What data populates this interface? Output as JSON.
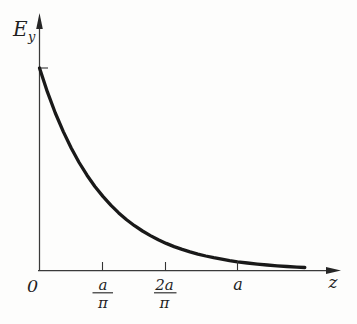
{
  "labels": {
    "y_axis": {
      "main": "E",
      "sub": "y"
    },
    "x_axis": "z",
    "origin": "0"
  },
  "chart_data": {
    "type": "line",
    "title": "",
    "xlabel": "z",
    "ylabel": "Ey",
    "curve_model": "Ey/E0 = exp(-pi*z/a)",
    "x_unit": "z in units of a",
    "y_unit": "Ey in units of E0 (E0 marked by unlabeled tick on vertical axis)",
    "xlim_z_over_a": [
      0,
      1.47
    ],
    "ylim_Ey_over_E0": [
      0,
      1.22
    ],
    "grid": false,
    "legend": false,
    "x": [
      0.0,
      0.04,
      0.08,
      0.12,
      0.16,
      0.2,
      0.24,
      0.28,
      0.32,
      0.36,
      0.4,
      0.44,
      0.48,
      0.52,
      0.56,
      0.6,
      0.64,
      0.68,
      0.72,
      0.76,
      0.8,
      0.84,
      0.88,
      0.92,
      0.96,
      1.0,
      1.05,
      1.1,
      1.15,
      1.2,
      1.25,
      1.3,
      1.34
    ],
    "y": [
      1.0,
      0.8819,
      0.7778,
      0.6859,
      0.6049,
      0.5335,
      0.4705,
      0.415,
      0.366,
      0.3228,
      0.2846,
      0.251,
      0.2214,
      0.1953,
      0.1722,
      0.1518,
      0.1339,
      0.1181,
      0.1041,
      0.0918,
      0.081,
      0.0714,
      0.063,
      0.0556,
      0.049,
      0.0432,
      0.0369,
      0.0316,
      0.027,
      0.0231,
      0.0197,
      0.0169,
      0.0148
    ],
    "x_ticks": [
      {
        "numerator": "a",
        "denominator": "π",
        "z_over_a": 0.3183
      },
      {
        "numerator": "2a",
        "denominator": "π",
        "z_over_a": 0.6366
      },
      {
        "label": "a",
        "z_over_a": 1.0
      }
    ],
    "y_ticks": [
      {
        "label": "",
        "Ey_over_E0": 1.0
      }
    ]
  }
}
